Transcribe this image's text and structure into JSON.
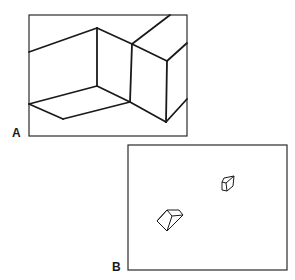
{
  "figure": {
    "panels": [
      {
        "id": "A",
        "label": "A",
        "description": "Close-up of large box edges drawn in perspective, filling frame"
      },
      {
        "id": "B",
        "label": "B",
        "description": "Two small cubes drawn at different sizes within frame"
      }
    ]
  },
  "colors": {
    "line": "#1a1a1a",
    "frame": "#2a2a2a",
    "background": "#ffffff"
  }
}
